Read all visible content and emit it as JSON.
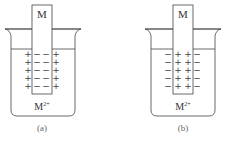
{
  "figures": [
    {
      "id": "a",
      "electrode_label": "M",
      "ion_label_base": "M",
      "ion_label_sup": "2+",
      "caption": "(a)",
      "inner_sign": "−",
      "outer_sign": "+",
      "rows": 5
    },
    {
      "id": "b",
      "electrode_label": "M",
      "ion_label_base": "M",
      "ion_label_sup": "2+",
      "caption": "(b)",
      "inner_sign": "+",
      "outer_sign": "−",
      "rows": 5
    }
  ],
  "colors": {
    "line": "#444444",
    "text": "#333333"
  }
}
